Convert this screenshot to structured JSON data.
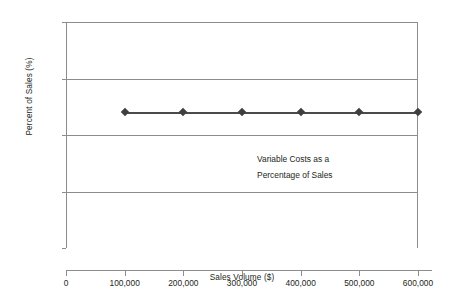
{
  "chart_data": {
    "type": "line",
    "title": "",
    "subtitle": "",
    "xlabel": "Sales Volume ($)",
    "ylabel": "Percent of Sales (%)",
    "xlim": [
      0,
      600000
    ],
    "ylim": [
      0,
      100
    ],
    "grid": "horizontal",
    "legend": "none",
    "x_ticks": [
      0,
      100000,
      200000,
      300000,
      400000,
      500000,
      600000
    ],
    "x_tick_labels": [
      "0",
      "100,000",
      "200,000",
      "300,000",
      "400,000",
      "500,000",
      "600,000"
    ],
    "y_ticks": [
      0,
      25,
      50,
      75,
      100
    ],
    "y_tick_labels": [
      "0",
      "25",
      "50",
      "75",
      "100"
    ],
    "series": [
      {
        "name": "Variable Costs as a Percentage of Sales",
        "marker": "diamond",
        "line_color": "#4a4a4a",
        "marker_color": "#3f3f3f",
        "x": [
          100000,
          200000,
          300000,
          400000,
          500000,
          600000
        ],
        "values": [
          60,
          60,
          60,
          60,
          60,
          60
        ]
      }
    ],
    "annotations": [
      {
        "lines": [
          "Variable Costs as a",
          "Percentage of Sales"
        ],
        "x": 390000,
        "y": 38
      }
    ],
    "colors": {
      "axis": "#8d8d8d",
      "gridline": "#8d8d8d",
      "text": "#231f20",
      "background": "#ffffff",
      "series": "#4a4a4a"
    }
  }
}
